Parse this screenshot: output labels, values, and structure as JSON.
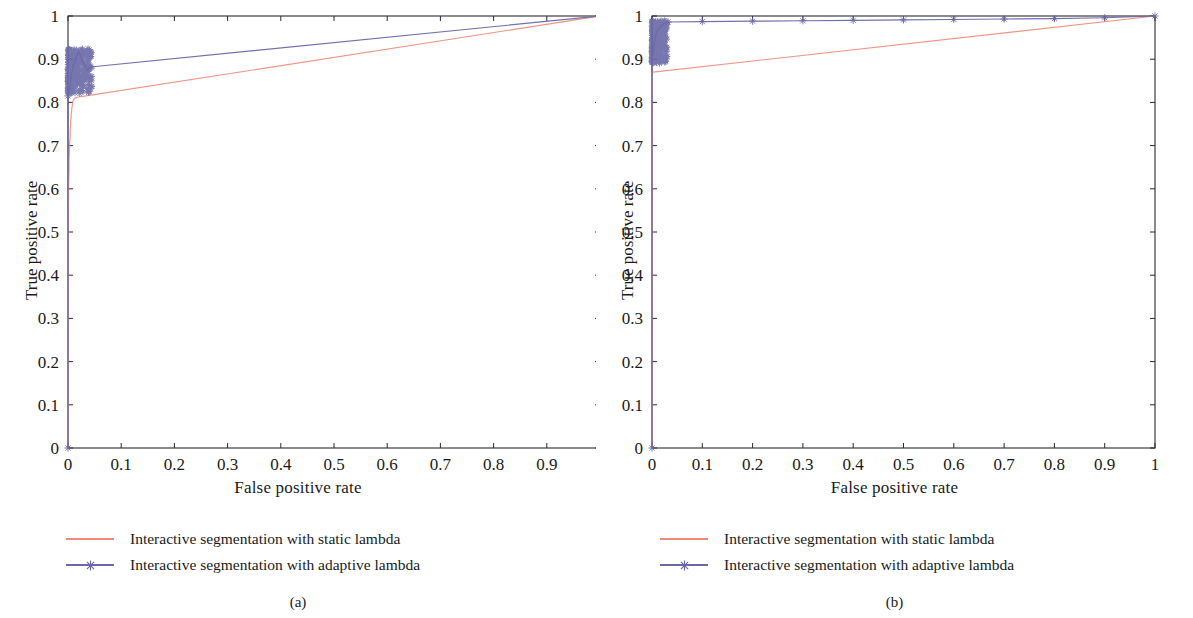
{
  "figure": {
    "panels": [
      {
        "caption": "(a)",
        "axes": {
          "xlabel": "False positive rate",
          "ylabel": "True positive rate",
          "xticks": [
            "0",
            "0.1",
            "0.2",
            "0.3",
            "0.4",
            "0.5",
            "0.6",
            "0.7",
            "0.8",
            "0.9",
            "1"
          ],
          "yticks": [
            "0",
            "0.1",
            "0.2",
            "0.3",
            "0.4",
            "0.5",
            "0.6",
            "0.7",
            "0.8",
            "0.9",
            "1"
          ]
        },
        "legend": [
          {
            "label": "Interactive segmentation with static lambda",
            "color": "#ef8a78",
            "marker": "none"
          },
          {
            "label": "Interactive segmentation with adaptive lambda",
            "color": "#6a68a8",
            "marker": "star"
          }
        ]
      },
      {
        "caption": "(b)",
        "axes": {
          "xlabel": "False positive rate",
          "ylabel": "True positive rate",
          "xticks": [
            "0",
            "0.1",
            "0.2",
            "0.3",
            "0.4",
            "0.5",
            "0.6",
            "0.7",
            "0.8",
            "0.9",
            "1"
          ],
          "yticks": [
            "0",
            "0.1",
            "0.2",
            "0.3",
            "0.4",
            "0.5",
            "0.6",
            "0.7",
            "0.8",
            "0.9",
            "1"
          ]
        },
        "legend": [
          {
            "label": "Interactive segmentation with static lambda",
            "color": "#ef8a78",
            "marker": "none"
          },
          {
            "label": "Interactive segmentation with adaptive lambda",
            "color": "#6a68a8",
            "marker": "star"
          }
        ]
      }
    ]
  },
  "chart_data": [
    {
      "type": "line",
      "title": "",
      "panel": "(a)",
      "xlabel": "False positive rate",
      "ylabel": "True positive rate",
      "xlim": [
        0,
        1
      ],
      "ylim": [
        0,
        1
      ],
      "xticks": [
        0,
        0.1,
        0.2,
        0.3,
        0.4,
        0.5,
        0.6,
        0.7,
        0.8,
        0.9,
        1
      ],
      "yticks": [
        0,
        0.1,
        0.2,
        0.3,
        0.4,
        0.5,
        0.6,
        0.7,
        0.8,
        0.9,
        1
      ],
      "grid": false,
      "legend_position": "below",
      "series": [
        {
          "name": "Interactive segmentation with static lambda",
          "color": "#ef8a78",
          "marker": "none",
          "points": [
            [
              0.0,
              0.0
            ],
            [
              0.0,
              0.5
            ],
            [
              0.001,
              0.58
            ],
            [
              0.001,
              0.6
            ],
            [
              0.002,
              0.645
            ],
            [
              0.002,
              0.67
            ],
            [
              0.003,
              0.695
            ],
            [
              0.003,
              0.705
            ],
            [
              0.004,
              0.72
            ],
            [
              0.004,
              0.735
            ],
            [
              0.005,
              0.748
            ],
            [
              0.005,
              0.758
            ],
            [
              0.006,
              0.766
            ],
            [
              0.006,
              0.774
            ],
            [
              0.007,
              0.781
            ],
            [
              0.007,
              0.786
            ],
            [
              0.008,
              0.791
            ],
            [
              0.008,
              0.795
            ],
            [
              0.009,
              0.799
            ],
            [
              0.009,
              0.802
            ],
            [
              0.01,
              0.805
            ],
            [
              0.011,
              0.807
            ],
            [
              0.012,
              0.809
            ],
            [
              0.013,
              0.81
            ],
            [
              0.015,
              0.811
            ],
            [
              0.018,
              0.812
            ],
            [
              0.022,
              0.813
            ],
            [
              0.028,
              0.814
            ],
            [
              0.034,
              0.815
            ],
            [
              1.0,
              1.0
            ]
          ]
        },
        {
          "name": "Interactive segmentation with adaptive lambda",
          "color": "#6a68a8",
          "marker": "star",
          "points": [
            [
              0.0,
              0.0
            ],
            [
              0.0,
              0.815
            ],
            [
              0.002,
              0.822
            ],
            [
              0.003,
              0.83
            ],
            [
              0.004,
              0.838
            ],
            [
              0.005,
              0.845
            ],
            [
              0.004,
              0.852
            ],
            [
              0.006,
              0.856
            ],
            [
              0.005,
              0.861
            ],
            [
              0.007,
              0.865
            ],
            [
              0.006,
              0.869
            ],
            [
              0.008,
              0.872
            ],
            [
              0.007,
              0.875
            ],
            [
              0.009,
              0.878
            ],
            [
              0.008,
              0.881
            ],
            [
              0.01,
              0.884
            ],
            [
              0.009,
              0.886
            ],
            [
              0.012,
              0.889
            ],
            [
              0.011,
              0.892
            ],
            [
              0.014,
              0.895
            ],
            [
              0.013,
              0.898
            ],
            [
              0.016,
              0.901
            ],
            [
              0.015,
              0.905
            ],
            [
              0.018,
              0.909
            ],
            [
              0.017,
              0.913
            ],
            [
              0.02,
              0.917
            ],
            [
              0.022,
              0.912
            ],
            [
              0.025,
              0.903
            ],
            [
              0.028,
              0.895
            ],
            [
              0.031,
              0.888
            ],
            [
              0.034,
              0.88
            ],
            [
              0.037,
              0.874
            ],
            [
              0.04,
              0.88
            ],
            [
              0.042,
              0.882
            ],
            [
              1.0,
              1.0
            ]
          ],
          "cluster_note": "dense scatter of star markers between FPR 0.00-0.045 and TPR 0.82-0.925"
        }
      ]
    },
    {
      "type": "line",
      "title": "",
      "panel": "(b)",
      "xlabel": "False positive rate",
      "ylabel": "True positive rate",
      "xlim": [
        0,
        1
      ],
      "ylim": [
        0,
        1
      ],
      "xticks": [
        0,
        0.1,
        0.2,
        0.3,
        0.4,
        0.5,
        0.6,
        0.7,
        0.8,
        0.9,
        1
      ],
      "yticks": [
        0,
        0.1,
        0.2,
        0.3,
        0.4,
        0.5,
        0.6,
        0.7,
        0.8,
        0.9,
        1
      ],
      "grid": false,
      "legend_position": "below",
      "series": [
        {
          "name": "Interactive segmentation with static lambda",
          "color": "#ef8a78",
          "marker": "none",
          "points": [
            [
              0.0,
              0.0
            ],
            [
              0.0,
              0.37
            ],
            [
              0.0,
              0.5
            ],
            [
              0.0,
              0.58
            ],
            [
              0.0,
              0.62
            ],
            [
              0.0,
              0.66
            ],
            [
              0.0,
              0.72
            ],
            [
              0.0,
              0.77
            ],
            [
              0.0,
              0.8
            ],
            [
              0.0,
              0.83
            ],
            [
              0.0,
              0.855
            ],
            [
              0.0,
              0.868
            ],
            [
              0.002,
              0.87
            ],
            [
              1.0,
              1.0
            ]
          ]
        },
        {
          "name": "Interactive segmentation with adaptive lambda",
          "color": "#6a68a8",
          "marker": "star",
          "points": [
            [
              0.0,
              0.0
            ],
            [
              0.0,
              0.895
            ],
            [
              0.001,
              0.905
            ],
            [
              0.002,
              0.912
            ],
            [
              0.002,
              0.918
            ],
            [
              0.003,
              0.922
            ],
            [
              0.003,
              0.928
            ],
            [
              0.004,
              0.933
            ],
            [
              0.004,
              0.938
            ],
            [
              0.005,
              0.942
            ],
            [
              0.006,
              0.946
            ],
            [
              0.006,
              0.95
            ],
            [
              0.007,
              0.953
            ],
            [
              0.008,
              0.957
            ],
            [
              0.009,
              0.96
            ],
            [
              0.01,
              0.963
            ],
            [
              0.011,
              0.966
            ],
            [
              0.013,
              0.969
            ],
            [
              0.015,
              0.972
            ],
            [
              0.017,
              0.975
            ],
            [
              0.019,
              0.978
            ],
            [
              0.022,
              0.981
            ],
            [
              0.025,
              0.983
            ],
            [
              0.028,
              0.985
            ],
            [
              0.032,
              0.986
            ],
            [
              0.1,
              0.987
            ],
            [
              0.2,
              0.988
            ],
            [
              0.3,
              0.989
            ],
            [
              0.4,
              0.99
            ],
            [
              0.5,
              0.991
            ],
            [
              0.6,
              0.992
            ],
            [
              0.7,
              0.993
            ],
            [
              0.8,
              0.994
            ],
            [
              0.9,
              0.996
            ],
            [
              1.0,
              1.0
            ]
          ],
          "cluster_note": "dense scatter of star markers between FPR 0.00-0.03 and TPR 0.89-0.99"
        }
      ]
    }
  ]
}
